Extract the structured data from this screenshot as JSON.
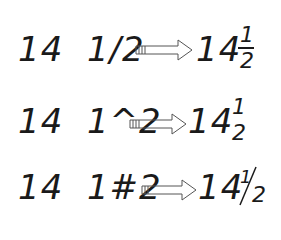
{
  "rows": [
    {
      "input": "14  1/2",
      "output_whole": "14",
      "numerator": "1",
      "denominator": "2",
      "style": "stacked-bar"
    },
    {
      "input": "14  1^2",
      "output_whole": "14",
      "numerator": "1",
      "denominator": "2",
      "style": "stacked-no-bar"
    },
    {
      "input": "14  1#2",
      "output_whole": "14",
      "numerator": "1",
      "denominator": "2",
      "style": "diagonal"
    }
  ],
  "arrow_icon": "hollow-right-arrow"
}
